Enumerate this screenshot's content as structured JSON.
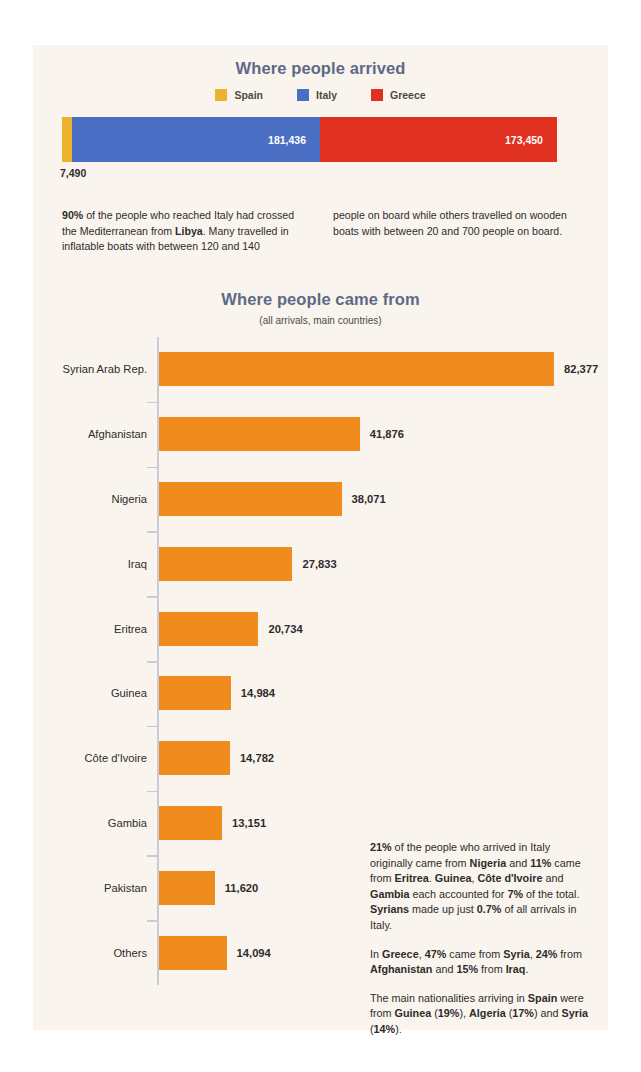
{
  "colors": {
    "page_background": "#ffffff",
    "panel_background": "#faf4ee",
    "title": "#5d6a86",
    "spain": "#edb12e",
    "italy": "#4a6fc4",
    "greece": "#e03020",
    "bar_orange": "#f08b1e",
    "axis": "#c9cbd8",
    "body_text": "#2e2c2b"
  },
  "arrived": {
    "title": "Where people arrived",
    "legend": [
      {
        "label": "Spain",
        "color": "#edb12e"
      },
      {
        "label": "Italy",
        "color": "#4a6fc4"
      },
      {
        "label": "Greece",
        "color": "#e03020"
      }
    ],
    "spain_outside_value": "7,490"
  },
  "intro": {
    "left_html": "<b>90%</b> of the people who reached Italy had crossed the Mediterranean from <b>Libya</b>. Many travelled in inflatable boats with between 120 and 140",
    "right_html": "people on board while others travelled on wooden boats with between 20 and 700 people on board."
  },
  "came_from": {
    "title": "Where people came from",
    "subtitle": "(all arrivals, main countries)"
  },
  "notes": [
    "<b>21%</b> of the people who arrived in Italy originally came from <b>Nigeria</b> and <b>11%</b> came from <b>Eritrea</b>. <b>Guinea</b>, <b>Côte d'Ivoire</b> and <b>Gambia</b> each accounted for <b>7%</b> of the total. <b>Syrians</b> made up just <b>0.7%</b> of all arrivals in Italy.",
    "In <b>Greece</b>, <b>47%</b> came from <b>Syria</b>, <b>24%</b> from <b>Afghanistan</b> and <b>15%</b> from <b>Iraq</b>.",
    "The main nationalities arriving in <b>Spain</b> were from <b>Guinea</b> (<b>19%</b>), <b>Algeria</b> (<b>17%</b>) and <b>Syria</b> (<b>14%</b>)."
  ],
  "chart_data": [
    {
      "type": "bar",
      "orientation": "horizontal-stacked",
      "title": "Where people arrived",
      "subtitle": "",
      "categories": [
        "Spain",
        "Italy",
        "Greece"
      ],
      "values": [
        7490,
        181436,
        173450
      ],
      "value_labels": [
        "7,490",
        "181,436",
        "173,450"
      ],
      "colors": [
        "#edb12e",
        "#4a6fc4",
        "#e03020"
      ],
      "total": 362376,
      "legend": [
        "Spain",
        "Italy",
        "Greece"
      ],
      "legend_position": "top-center",
      "grid": false,
      "xlabel": "",
      "ylabel": ""
    },
    {
      "type": "bar",
      "orientation": "horizontal",
      "title": "Where people came from",
      "subtitle": "(all arrivals, main countries)",
      "categories": [
        "Syrian Arab Rep.",
        "Afghanistan",
        "Nigeria",
        "Iraq",
        "Eritrea",
        "Guinea",
        "Côte d'Ivoire",
        "Gambia",
        "Pakistan",
        "Others"
      ],
      "values": [
        82377,
        41876,
        38071,
        27833,
        20734,
        14984,
        14782,
        13151,
        11620,
        14094
      ],
      "value_labels": [
        "82,377",
        "41,876",
        "38,071",
        "27,833",
        "20,734",
        "14,984",
        "14,782",
        "13,151",
        "11,620",
        "14,094"
      ],
      "color": "#f08b1e",
      "xlim": [
        0,
        82377
      ],
      "xlabel": "",
      "ylabel": "",
      "grid": false,
      "legend_position": "none"
    }
  ]
}
